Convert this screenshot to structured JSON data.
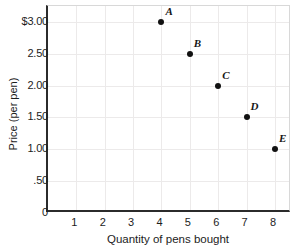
{
  "chart_data": {
    "type": "scatter",
    "title": "",
    "xlabel": "Quantity of pens bought",
    "ylabel": "Price (per pen)",
    "xlim": [
      0,
      8.6
    ],
    "ylim": [
      0,
      3.25
    ],
    "grid": true,
    "legend": "none",
    "x_ticks": [
      "1",
      "2",
      "3",
      "4",
      "5",
      "6",
      "7",
      "8"
    ],
    "x_tick_values": [
      1,
      2,
      3,
      4,
      5,
      6,
      7,
      8
    ],
    "y_ticks": [
      "0",
      ".50",
      "1.00",
      "1.50",
      "2.00",
      "2.50",
      "$3.00"
    ],
    "y_tick_values": [
      0,
      0.5,
      1.0,
      1.5,
      2.0,
      2.5,
      3.0
    ],
    "point_color": "#111111",
    "axis_color": "#2b2b2b",
    "grid_color": "#eceaea",
    "points": [
      {
        "label": "A",
        "x": 4,
        "y": 3.0
      },
      {
        "label": "B",
        "x": 5,
        "y": 2.5
      },
      {
        "label": "C",
        "x": 6,
        "y": 2.0
      },
      {
        "label": "D",
        "x": 7,
        "y": 1.5
      },
      {
        "label": "E",
        "x": 8,
        "y": 1.0
      }
    ]
  }
}
